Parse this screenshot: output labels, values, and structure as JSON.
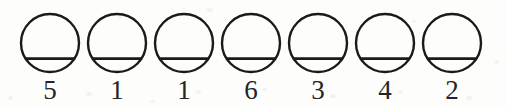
{
  "figure": {
    "title": "",
    "background_color": "#fdfdfb",
    "ink_color": "#1a1a1a",
    "digit_color": "#242424",
    "item_count": 7
  },
  "symbols": [
    {
      "shape": "circle-with-horizontal-chord",
      "label": "5"
    },
    {
      "shape": "circle-with-horizontal-chord",
      "label": "1"
    },
    {
      "shape": "circle-with-horizontal-chord",
      "label": "1"
    },
    {
      "shape": "circle-with-horizontal-chord",
      "label": "6"
    },
    {
      "shape": "circle-with-horizontal-chord",
      "label": "3"
    },
    {
      "shape": "circle-with-horizontal-chord",
      "label": "4"
    },
    {
      "shape": "circle-with-horizontal-chord",
      "label": "2"
    }
  ],
  "sequence_text": "5 1 1 6 3 4 2",
  "geometry": {
    "circle_diameter_px": 58,
    "circle_pitch_px": 67,
    "first_circle_left_px": 21,
    "circle_top_px": 13,
    "chord_fraction_of_height": 0.77,
    "stroke_width_px": 2.4,
    "digit_baseline_px": 104
  },
  "speckles": [
    {
      "x": 8,
      "y": 96,
      "w": 5,
      "h": 4
    },
    {
      "x": 86,
      "y": 92,
      "w": 6,
      "h": 4
    },
    {
      "x": 118,
      "y": 16,
      "w": 4,
      "h": 3
    },
    {
      "x": 196,
      "y": 90,
      "w": 5,
      "h": 4
    },
    {
      "x": 206,
      "y": 8,
      "w": 7,
      "h": 4
    },
    {
      "x": 262,
      "y": 88,
      "w": 5,
      "h": 3
    },
    {
      "x": 330,
      "y": 94,
      "w": 6,
      "h": 4
    },
    {
      "x": 398,
      "y": 90,
      "w": 5,
      "h": 4
    },
    {
      "x": 412,
      "y": 20,
      "w": 4,
      "h": 3
    },
    {
      "x": 466,
      "y": 96,
      "w": 6,
      "h": 4
    },
    {
      "x": 494,
      "y": 60,
      "w": 5,
      "h": 4
    },
    {
      "x": 150,
      "y": 100,
      "w": 5,
      "h": 3
    }
  ]
}
